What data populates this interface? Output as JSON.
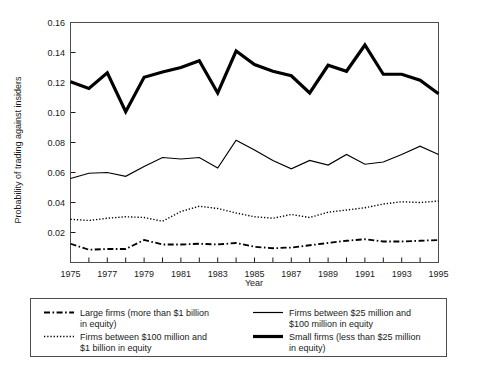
{
  "chart_data": {
    "type": "line",
    "title": "",
    "xlabel": "Year",
    "ylabel": "Probability of trading against insiders",
    "xlim": [
      1975,
      1995
    ],
    "ylim": [
      0,
      0.16
    ],
    "ytick_labels": [
      "0.16",
      "0.14",
      "0.12",
      "0.10",
      "0.08",
      "0.06",
      "0.04",
      "0.02"
    ],
    "ytick_values": [
      0.16,
      0.14,
      0.12,
      0.1,
      0.08,
      0.06,
      0.04,
      0.02
    ],
    "xtick_labels": [
      "1975",
      "1977",
      "1979",
      "1981",
      "1983",
      "1985",
      "1987",
      "1989",
      "1991",
      "1993",
      "1995"
    ],
    "xtick_values": [
      1975,
      1977,
      1979,
      1981,
      1983,
      1985,
      1987,
      1989,
      1991,
      1993,
      1995
    ],
    "xtick_minor_values": [
      1976,
      1978,
      1980,
      1982,
      1984,
      1986,
      1988,
      1990,
      1992,
      1994
    ],
    "grid": false,
    "legend_position": "below",
    "x": [
      1975,
      1976,
      1977,
      1978,
      1979,
      1980,
      1981,
      1982,
      1983,
      1984,
      1985,
      1986,
      1987,
      1988,
      1989,
      1990,
      1991,
      1992,
      1993,
      1994,
      1995
    ],
    "series": [
      {
        "name": "Small firms (less than $25 million in equity)",
        "style": "thick-solid",
        "values": [
          0.1205,
          0.116,
          0.1265,
          0.1005,
          0.1235,
          0.127,
          0.13,
          0.1345,
          0.113,
          0.141,
          0.132,
          0.1275,
          0.1245,
          0.113,
          0.1315,
          0.1275,
          0.145,
          0.1255,
          0.1255,
          0.1215,
          0.1125
        ]
      },
      {
        "name": "Firms between $25 million and $100 million in equity",
        "style": "thin-solid",
        "values": [
          0.056,
          0.0595,
          0.06,
          0.0575,
          0.064,
          0.07,
          0.069,
          0.07,
          0.063,
          0.0815,
          0.075,
          0.068,
          0.0625,
          0.068,
          0.065,
          0.072,
          0.0655,
          0.067,
          0.072,
          0.0775,
          0.072
        ]
      },
      {
        "name": "Firms between $100 million and $1 billion in equity",
        "style": "dotted",
        "values": [
          0.0288,
          0.028,
          0.0295,
          0.0305,
          0.03,
          0.0275,
          0.034,
          0.0375,
          0.036,
          0.033,
          0.0305,
          0.0295,
          0.032,
          0.03,
          0.0335,
          0.035,
          0.0365,
          0.039,
          0.0405,
          0.04,
          0.041
        ]
      },
      {
        "name": "Large firms (more than $1 billion in equity)",
        "style": "dash-dot",
        "values": [
          0.0125,
          0.0085,
          0.009,
          0.009,
          0.015,
          0.012,
          0.012,
          0.0125,
          0.012,
          0.013,
          0.0105,
          0.0095,
          0.01,
          0.0115,
          0.013,
          0.0145,
          0.0155,
          0.014,
          0.014,
          0.0145,
          0.015
        ]
      }
    ]
  },
  "legend": {
    "items": [
      {
        "style": "dash-dot",
        "line1": "Large firms (more than $1 billion",
        "line2": "in equity)"
      },
      {
        "style": "dotted",
        "line1": "Firms between $100 million and",
        "line2": "$1 billion in equity"
      },
      {
        "style": "thin-solid",
        "line1": "Firms between $25 million and",
        "line2": "$100 million in equity"
      },
      {
        "style": "thick-solid",
        "line1": "Small firms (less than $25 million",
        "line2": "in equity)"
      }
    ]
  },
  "colors": {
    "line": "#000000",
    "frame": "#4d4d4d",
    "text": "#1a1a1a",
    "background": "#ffffff"
  }
}
